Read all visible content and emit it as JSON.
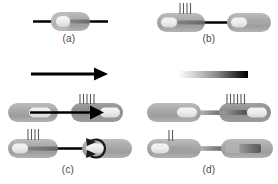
{
  "figure": {
    "width": 278,
    "height": 184,
    "background": "#ffffff"
  },
  "colors": {
    "background": "#ffffff",
    "capsule_body": "#a8a8a8",
    "capsule_body_dark": "#8e8e8e",
    "capsule_cap_light": "#efefef",
    "capsule_cap_mid": "#c9c9c9",
    "capsule_inner_dark": "#6e6e6e",
    "line_black": "#000000",
    "bristle": "#5a5a5a",
    "label_text": "#4a4a4a",
    "gradient_start": "#ffffff",
    "gradient_end": "#000000"
  },
  "panels": [
    {
      "id": "a",
      "label": "(a)",
      "description": "Single capsule threaded on a straight horizontal black line",
      "elements": [
        {
          "name": "horizontal-line",
          "type": "line"
        },
        {
          "name": "capsule",
          "type": "capsule",
          "bristles": 0,
          "cap_side": "left"
        }
      ]
    },
    {
      "id": "b",
      "label": "(b)",
      "description": "Two capsules joined by a black connecting rod; left capsule carries four bristles",
      "elements": [
        {
          "name": "capsule-left",
          "type": "capsule",
          "bristles": 4,
          "cap_side": "left"
        },
        {
          "name": "connector-rod",
          "type": "line"
        },
        {
          "name": "capsule-right",
          "type": "capsule",
          "bristles": 0,
          "cap_side": "left"
        }
      ]
    },
    {
      "id": "c",
      "label": "(c)",
      "description": "Directional arrow above two rows: top row shows a long arrow piercing two capsules toward a bristled right capsule; bottom row shows bristles moved to the left capsule and a curved arrow at the right capsule",
      "elements": [
        {
          "name": "direction-arrow",
          "type": "arrow",
          "direction": "right"
        },
        {
          "name": "row-1-capsule-left",
          "type": "capsule",
          "bristles": 0,
          "cap_side": "center"
        },
        {
          "name": "row-1-arrow",
          "type": "arrow",
          "direction": "right"
        },
        {
          "name": "row-1-capsule-right",
          "type": "capsule",
          "bristles": 5,
          "cap_side": "right"
        },
        {
          "name": "row-2-capsule-left",
          "type": "capsule",
          "bristles": 4,
          "cap_side": "left"
        },
        {
          "name": "row-2-connector",
          "type": "line"
        },
        {
          "name": "row-2-capsule-right",
          "type": "capsule",
          "bristles": 0,
          "cap_side": "center"
        },
        {
          "name": "row-2-curved-arrow",
          "type": "curved-arrow",
          "direction": "clockwise"
        }
      ]
    },
    {
      "id": "d",
      "label": "(d)",
      "description": "Grayscale gradient bar above two rows of paired capsules joined by shaded rods; top-right capsule carries six bristles, bottom-left capsule carries two bristles",
      "elements": [
        {
          "name": "gradient-bar",
          "type": "gradient",
          "from": "#ffffff",
          "to": "#000000"
        },
        {
          "name": "row-1-capsule-left",
          "type": "capsule",
          "bristles": 0,
          "cap_side": "right"
        },
        {
          "name": "row-1-connector",
          "type": "gradient-rod"
        },
        {
          "name": "row-1-capsule-right",
          "type": "capsule",
          "bristles": 6,
          "cap_side": "right"
        },
        {
          "name": "row-2-capsule-left",
          "type": "capsule",
          "bristles": 2,
          "cap_side": "left"
        },
        {
          "name": "row-2-connector",
          "type": "gradient-rod"
        },
        {
          "name": "row-2-capsule-right",
          "type": "capsule",
          "bristles": 0,
          "cap_side": "center"
        }
      ]
    }
  ],
  "labels": {
    "a": "(a)",
    "b": "(b)",
    "c": "(c)",
    "d": "(d)"
  }
}
